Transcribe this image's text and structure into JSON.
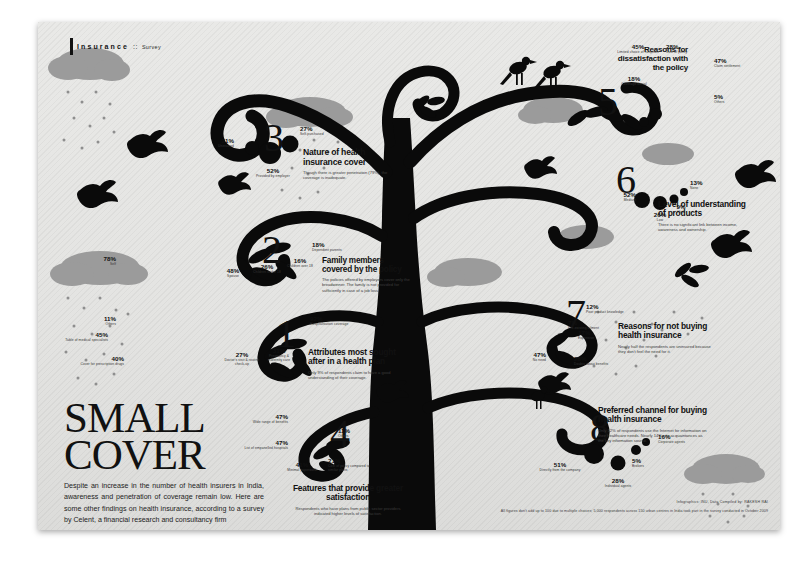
{
  "header": {
    "label": "Insurance",
    "separator": "::",
    "section": "Survey"
  },
  "title": {
    "line1": "SMALL",
    "line2": "COVER",
    "dek": "Despite an increase in the number of health insurers in India, awareness and penetration of coverage remain low. Here are some other findings on health insurance, according to a survey by Celent, a financial research and consultancy firm"
  },
  "footer": {
    "credit": "Infographics: INU, Data Compiled by: RAKESH RAI",
    "note": "All figures don't add up to 100 due to multiple choices; 5,000 respondents across 150 urban centres in India took part in the survey conducted in October 2009"
  },
  "sections": [
    {
      "num": "1",
      "title": "Attributes most sought after in a health plan",
      "desc": "Only 9% of respondents claim to have a good understanding of their coverage.",
      "items": [
        {
          "value": "92%",
          "label": "Hospitalisation coverage"
        },
        {
          "value": "45%",
          "label": "Table of medical specialists"
        },
        {
          "value": "40%",
          "label": "Cover for prescription drugs"
        },
        {
          "value": "31%",
          "label": "Pregnancy & maternity care"
        },
        {
          "value": "27%",
          "label": "Doctor's visit & routine check-up"
        },
        {
          "value": "11%",
          "label": "Others"
        }
      ]
    },
    {
      "num": "2",
      "title": "Family members covered by the policy",
      "desc": "The policies offered by employers cover only the breadwinner. The family is not provided for sufficiently in case of a job loss.",
      "items": [
        {
          "value": "78%",
          "label": "Self"
        },
        {
          "value": "48%",
          "label": "Spouse"
        },
        {
          "value": "26%",
          "label": "Children under 18"
        },
        {
          "value": "18%",
          "label": "Dependent parents"
        },
        {
          "value": "16%",
          "label": "Children over 18"
        }
      ]
    },
    {
      "num": "3",
      "title": "Nature of health insurance cover",
      "desc": "Though there is greater penetration (79%), the coverage is inadequate.",
      "items": [
        {
          "value": "52%",
          "label": "Provided by employer"
        },
        {
          "value": "27%",
          "label": "Self-purchased"
        },
        {
          "value": "21%",
          "label": "Uninsured"
        }
      ]
    },
    {
      "num": "4",
      "title": "Features that provide greater satisfaction",
      "desc": "Respondents who have plans from public sector providers indicated higher levels of satisfaction.",
      "items": [
        {
          "value": "47%",
          "label": "Wide range of benefits"
        },
        {
          "value": "47%",
          "label": "List of empanelled hospitals"
        },
        {
          "value": "41%",
          "label": "Minimal paperwork"
        },
        {
          "value": "21%",
          "label": "Cost of policy compared to similar plans"
        },
        {
          "value": "11%",
          "label": "Others"
        }
      ]
    },
    {
      "num": "5",
      "title": "Reasons for dissatisfaction with the policy",
      "desc": "",
      "items": [
        {
          "value": "47%",
          "label": "Claim settlement"
        },
        {
          "value": "45%",
          "label": "Limited choice of hospitals"
        },
        {
          "value": "28%",
          "label": "Cost of policy"
        },
        {
          "value": "18%",
          "label": "Coverage denial"
        },
        {
          "value": "5%",
          "label": "Others"
        }
      ]
    },
    {
      "num": "6",
      "title": "Level of understanding of products",
      "desc": "There is no significant link between income, awareness and ownership.",
      "items": [
        {
          "value": "52%",
          "label": "Medium"
        },
        {
          "value": "26%",
          "label": "Low"
        },
        {
          "value": "13%",
          "label": "None"
        },
        {
          "value": "9%",
          "label": "High"
        }
      ]
    },
    {
      "num": "7",
      "title": "Reasons for not buying health insurance",
      "desc": "Nearly half the respondents are uninsured because they don't feel the need for it.",
      "items": [
        {
          "value": "47%",
          "label": "No need"
        },
        {
          "value": "28%",
          "label": "Doubts about benefits"
        },
        {
          "value": "17%",
          "label": "Expensive"
        },
        {
          "value": "12%",
          "label": "Poor product knowledge"
        },
        {
          "value": "7%",
          "label": "Pre-existing ailment"
        }
      ]
    },
    {
      "num": "8",
      "title": "Preferred channel for buying health insurance",
      "desc": "Only 12% of respondents use the Internet for information on their healthcare needs. Nearly 14% cite acquaintances as the key information source.",
      "items": [
        {
          "value": "51%",
          "label": "Directly from the company"
        },
        {
          "value": "28%",
          "label": "Individual agents"
        },
        {
          "value": "16%",
          "label": "Corporate agents"
        },
        {
          "value": "5%",
          "label": "Brokers"
        }
      ]
    }
  ],
  "colors": {
    "ink": "#111111",
    "paper": "#e6e6e4",
    "cloud": "#9a9a9a",
    "accent": "#000000"
  }
}
